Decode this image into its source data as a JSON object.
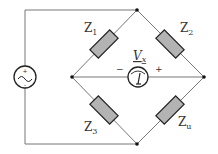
{
  "diagram": {
    "type": "Wheatstone / AC impedance bridge",
    "components": {
      "source": {
        "kind": "ac-voltage-source",
        "polarity_top": "+",
        "polarity_bottom": "-"
      },
      "z1": {
        "label": "Z",
        "sub": "1"
      },
      "z2": {
        "label": "Z",
        "sub": "2"
      },
      "z3": {
        "label": "Z",
        "sub": "3"
      },
      "zu": {
        "label": "Z",
        "sub": "u"
      },
      "meter": {
        "label": "V",
        "sub": "x",
        "minus": "−",
        "plus": "+"
      }
    },
    "colors": {
      "wire": "#777777",
      "impedance_fill": "#b3b3b3",
      "impedance_stroke": "#222222",
      "node": "#111111"
    }
  }
}
